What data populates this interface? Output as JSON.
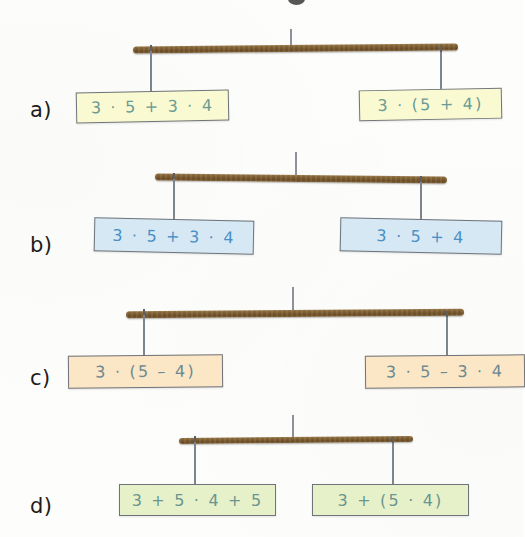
{
  "page": {
    "background_color": "#fdfdfb",
    "beam_color": "#7d5c30",
    "string_color": "#7e848c",
    "width": 523,
    "height": 537
  },
  "rows": [
    {
      "label": "a)",
      "box_fill": "#fafad2",
      "text_color": "#6c9b93",
      "left": {
        "expression": "3 · 5 + 3 · 4"
      },
      "right": {
        "expression": "3 · (5 + 4)"
      }
    },
    {
      "label": "b)",
      "box_fill": "#d6e8f3",
      "text_color": "#4a90c4",
      "left": {
        "expression": "3 · 5 + 3 · 4"
      },
      "right": {
        "expression": "3 · 5 + 4"
      }
    },
    {
      "label": "c)",
      "box_fill": "#fbe6c6",
      "text_color": "#6d8a93",
      "left": {
        "expression": "3 · (5 – 4)"
      },
      "right": {
        "expression": "3 · 5 – 3 · 4"
      }
    },
    {
      "label": "d)",
      "box_fill": "#e6f1c9",
      "text_color": "#6a9590",
      "left": {
        "expression": "3 + 5 · 4 + 5"
      },
      "right": {
        "expression": "3 + (5 · 4)"
      }
    }
  ]
}
